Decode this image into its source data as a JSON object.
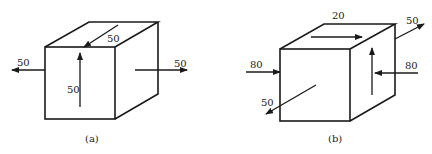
{
  "figures": [
    {
      "id": "a",
      "caption": "(a)",
      "stresses": [
        {
          "face": "left",
          "direction": "outward-left",
          "value": "50"
        },
        {
          "face": "right",
          "direction": "outward-right",
          "value": "50"
        },
        {
          "face": "front",
          "direction": "up",
          "value": "50"
        },
        {
          "face": "top",
          "direction": "toward-front-diagonal",
          "value": "50"
        }
      ]
    },
    {
      "id": "b",
      "caption": "(b)",
      "stresses": [
        {
          "face": "top",
          "direction": "right",
          "value": "20"
        },
        {
          "face": "back-corner",
          "direction": "outward-diagonal",
          "value": "50"
        },
        {
          "face": "left",
          "direction": "inward-right",
          "value": "80"
        },
        {
          "face": "right",
          "direction": "inward-left",
          "value": "80"
        },
        {
          "face": "right-side",
          "direction": "up",
          "value": ""
        },
        {
          "face": "front",
          "direction": "outward-diagonal-down-left",
          "value": "50"
        }
      ]
    }
  ],
  "colors": {
    "ink": "#1a1a1a",
    "background": "#ffffff"
  }
}
